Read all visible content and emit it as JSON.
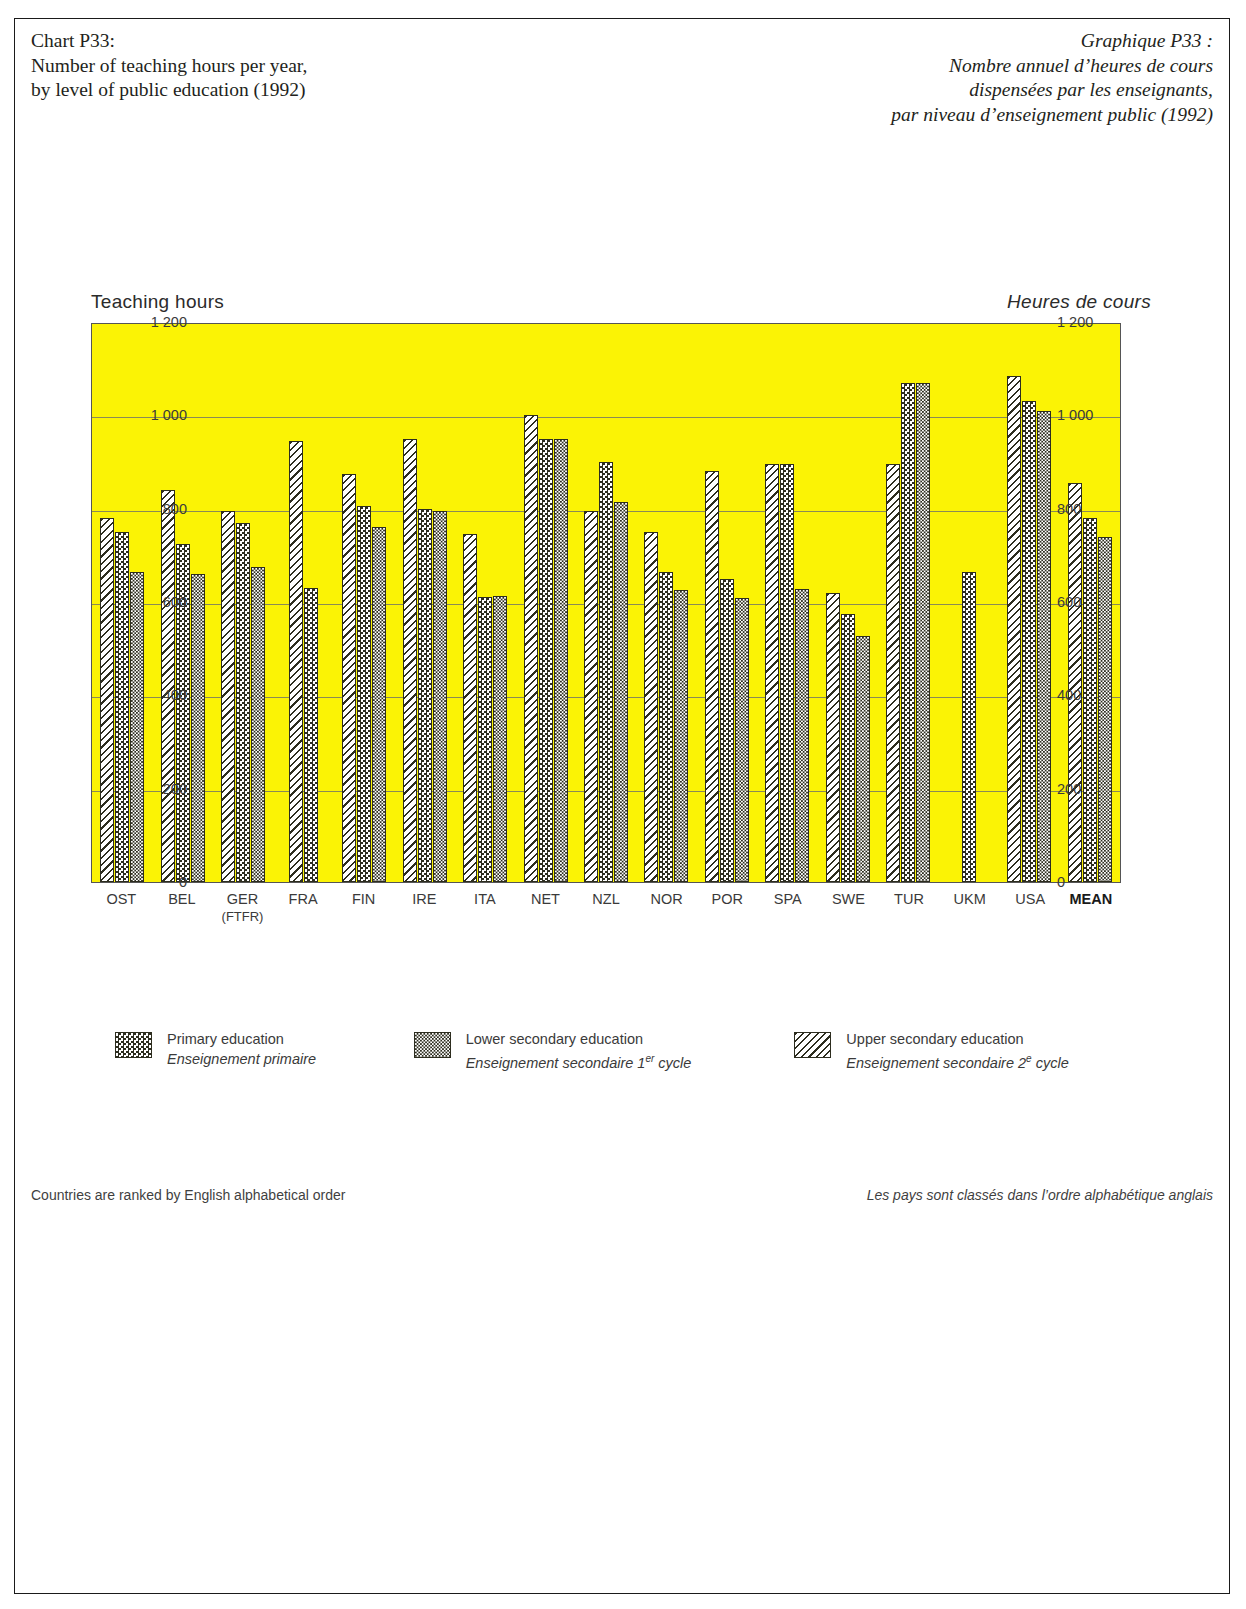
{
  "titles": {
    "english": "Chart P33:\nNumber of teaching hours per year,\nby level of public education (1992)",
    "french": "Graphique P33 :\nNombre annuel d’heures de cours\ndispensées par les enseignants,\npar niveau d’enseignement public (1992)"
  },
  "axis_titles": {
    "left": "Teaching hours",
    "right": "Heures de cours"
  },
  "legend": [
    {
      "pattern": "checker",
      "en": "Primary education",
      "fr": "Enseignement primaire"
    },
    {
      "pattern": "fine-checker",
      "en": "Lower secondary education",
      "fr_pre": "Enseignement secondaire 1",
      "fr_sup": "er",
      "fr_post": " cycle"
    },
    {
      "pattern": "diagonal-hatch",
      "en": "Upper secondary education",
      "fr_pre": "Enseignement secondaire 2",
      "fr_sup": "e",
      "fr_post": " cycle"
    }
  ],
  "notes": {
    "left": "Countries are ranked by English alphabetical order",
    "right": "Les pays sont classés dans l’ordre alphabétique anglais"
  },
  "colors": {
    "plot_background": "#fbf305",
    "bar_outline": "#2d2d1f",
    "gridline": "#8a8a55",
    "frame": "#1a1a1a"
  },
  "chart_data": {
    "type": "bar",
    "title": "Number of teaching hours per year, by level of public education (1992)",
    "xlabel": "",
    "ylabel": "Teaching hours",
    "ylim": [
      0,
      1200
    ],
    "ytick_labels": [
      "1 200",
      "1 000",
      "800",
      "600",
      "400",
      "200",
      "0"
    ],
    "ytick_values": [
      1200,
      1000,
      800,
      600,
      400,
      200,
      0
    ],
    "grid": true,
    "legend_position": "below-plot",
    "categories": [
      "OST",
      "BEL",
      "GER",
      "FRA",
      "FIN",
      "IRE",
      "ITA",
      "NET",
      "NZL",
      "NOR",
      "POR",
      "SPA",
      "SWE",
      "TUR",
      "UKM",
      "USA",
      "MEAN"
    ],
    "category_sublabels": {
      "GER": "(FTFR)"
    },
    "bold_categories": [
      "MEAN"
    ],
    "series": [
      {
        "name": "Upper secondary education",
        "pattern": "diagonal-hatch",
        "values": [
          780,
          840,
          795,
          945,
          875,
          950,
          745,
          1000,
          795,
          750,
          880,
          895,
          620,
          895,
          null,
          1085,
          855
        ]
      },
      {
        "name": "Primary education",
        "pattern": "checker",
        "values": [
          750,
          725,
          770,
          630,
          805,
          800,
          610,
          950,
          900,
          665,
          650,
          895,
          575,
          1070,
          665,
          1030,
          780
        ]
      },
      {
        "name": "Lower secondary education",
        "pattern": "fine-checker",
        "values": [
          665,
          660,
          675,
          null,
          760,
          795,
          612,
          950,
          815,
          625,
          608,
          628,
          528,
          1070,
          null,
          1010,
          740
        ]
      }
    ]
  }
}
